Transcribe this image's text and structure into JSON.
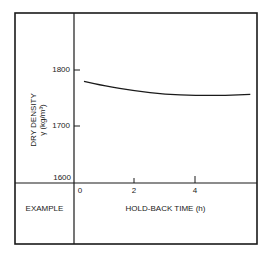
{
  "chart_data": {
    "type": "line",
    "title": "",
    "xlabel": "HOLD-BACK TIME (h)",
    "ylabel": "DRY DENSITY γ (kg/m³)",
    "ylabel_lines": [
      "DRY DENSITY",
      "γ (kg/m³)"
    ],
    "x_ticks": [
      0,
      2,
      4
    ],
    "y_ticks": [
      1600,
      1700,
      1800
    ],
    "xlim": [
      0,
      6
    ],
    "ylim": [
      1600,
      1800
    ],
    "grid": false,
    "legend": null,
    "series": [
      {
        "name": "dry density",
        "x": [
          0.33,
          1.0,
          2.0,
          3.0,
          4.0,
          5.0,
          5.8
        ],
        "y": [
          1780,
          1772,
          1763,
          1757,
          1755,
          1755,
          1757
        ]
      }
    ],
    "row_label": "EXAMPLE"
  },
  "labels": {
    "row_label": "EXAMPLE",
    "xlabel": "HOLD-BACK TIME (h)",
    "ylabel_line1": "DRY DENSITY",
    "ylabel_line2": "γ (kg/m³)",
    "ytick_1800": "1800",
    "ytick_1700": "1700",
    "ytick_1600": "1600",
    "xtick_0": "0",
    "xtick_2": "2",
    "xtick_4": "4"
  },
  "colors": {
    "ink": "#1a1a1a",
    "background": "#ffffff"
  }
}
